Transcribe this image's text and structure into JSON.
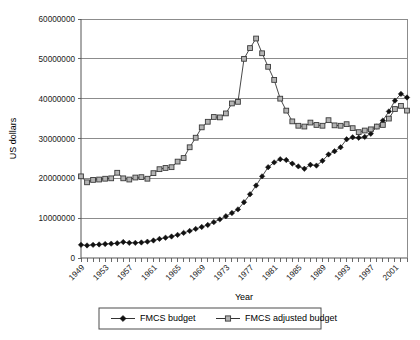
{
  "chart_data": {
    "type": "line",
    "title": "",
    "xlabel": "Year",
    "ylabel": "US dollars",
    "grid": true,
    "legend_position": "bottom",
    "xlim": [
      1949,
      2003
    ],
    "ylim": [
      0,
      60000000
    ],
    "ytick_labels": [
      "0",
      "10000000",
      "20000000",
      "30000000",
      "40000000",
      "50000000",
      "60000000"
    ],
    "ytick_values": [
      0,
      10000000,
      20000000,
      30000000,
      40000000,
      50000000,
      60000000
    ],
    "xtick_labels": [
      "1949",
      "1953",
      "1957",
      "1961",
      "1965",
      "1969",
      "1973",
      "1977",
      "1981",
      "1985",
      "1989",
      "1993",
      "1997",
      "2001"
    ],
    "xtick_values": [
      1949,
      1953,
      1957,
      1961,
      1965,
      1969,
      1973,
      1977,
      1981,
      1985,
      1989,
      1993,
      1997,
      2001
    ],
    "x": [
      1949,
      1950,
      1951,
      1952,
      1953,
      1954,
      1955,
      1956,
      1957,
      1958,
      1959,
      1960,
      1961,
      1962,
      1963,
      1964,
      1965,
      1966,
      1967,
      1968,
      1969,
      1970,
      1971,
      1972,
      1973,
      1974,
      1975,
      1976,
      1977,
      1978,
      1979,
      1980,
      1981,
      1982,
      1983,
      1984,
      1985,
      1986,
      1987,
      1988,
      1989,
      1990,
      1991,
      1992,
      1993,
      1994,
      1995,
      1996,
      1997,
      1998,
      1999,
      2000,
      2001,
      2002,
      2003
    ],
    "series": [
      {
        "name": "FMCS budget",
        "marker": "filled-diamond",
        "values": [
          3300000,
          3150000,
          3300000,
          3400000,
          3500000,
          3600000,
          3700000,
          4000000,
          3800000,
          3800000,
          3900000,
          4100000,
          4400000,
          4800000,
          5100000,
          5400000,
          5800000,
          6300000,
          6800000,
          7300000,
          7800000,
          8300000,
          9000000,
          9700000,
          10500000,
          11300000,
          12200000,
          14000000,
          16000000,
          18200000,
          20500000,
          22800000,
          24000000,
          24800000,
          24600000,
          23700000,
          23000000,
          22400000,
          23400000,
          23200000,
          24400000,
          26000000,
          26800000,
          27800000,
          29800000,
          30300000,
          30200000,
          30400000,
          31200000,
          33000000,
          34500000,
          36800000,
          39500000,
          41200000,
          40300000
        ]
      },
      {
        "name": "FMCS adjusted budget",
        "marker": "open-square",
        "values": [
          20500000,
          19000000,
          19600000,
          19700000,
          19900000,
          20000000,
          21400000,
          20000000,
          19700000,
          20200000,
          20300000,
          19900000,
          21300000,
          22300000,
          22600000,
          22800000,
          24200000,
          25100000,
          27800000,
          30200000,
          32800000,
          34200000,
          35400000,
          35300000,
          36300000,
          38800000,
          39200000,
          50000000,
          52700000,
          55100000,
          51400000,
          48000000,
          44700000,
          40000000,
          37000000,
          34300000,
          33200000,
          33000000,
          34000000,
          33400000,
          33200000,
          34600000,
          33300000,
          33200000,
          33600000,
          32600000,
          31600000,
          32000000,
          32300000,
          33000000,
          33400000,
          35000000,
          37400000,
          38200000,
          37000000
        ]
      }
    ]
  },
  "legend": {
    "items": [
      {
        "label": "FMCS budget",
        "marker": "filled-diamond"
      },
      {
        "label": "FMCS adjusted budget",
        "marker": "open-square"
      }
    ]
  }
}
